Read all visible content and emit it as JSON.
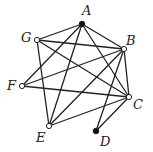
{
  "graph": {
    "nodes": [
      {
        "id": "A",
        "x": 82,
        "y": 24,
        "filled": true,
        "lx": 82,
        "ly": 15,
        "anchor": "start"
      },
      {
        "id": "G",
        "x": 37,
        "y": 40,
        "filled": false,
        "lx": 21,
        "ly": 42,
        "anchor": "start"
      },
      {
        "id": "B",
        "x": 124,
        "y": 49,
        "filled": false,
        "lx": 126,
        "ly": 45,
        "anchor": "start"
      },
      {
        "id": "F",
        "x": 22,
        "y": 86,
        "filled": false,
        "lx": 7,
        "ly": 90,
        "anchor": "start"
      },
      {
        "id": "C",
        "x": 129,
        "y": 97,
        "filled": false,
        "lx": 133,
        "ly": 109,
        "anchor": "start"
      },
      {
        "id": "E",
        "x": 49,
        "y": 126,
        "filled": false,
        "lx": 36,
        "ly": 142,
        "anchor": "start"
      },
      {
        "id": "D",
        "x": 96,
        "y": 131,
        "filled": true,
        "lx": 100,
        "ly": 146,
        "anchor": "start"
      }
    ],
    "edges": [
      [
        "A",
        "G"
      ],
      [
        "A",
        "B"
      ],
      [
        "A",
        "F"
      ],
      [
        "A",
        "E"
      ],
      [
        "A",
        "C"
      ],
      [
        "G",
        "B"
      ],
      [
        "G",
        "C"
      ],
      [
        "G",
        "E"
      ],
      [
        "B",
        "F"
      ],
      [
        "B",
        "E"
      ],
      [
        "B",
        "D"
      ],
      [
        "B",
        "C"
      ],
      [
        "F",
        "C"
      ],
      [
        "E",
        "C"
      ],
      [
        "C",
        "D"
      ]
    ],
    "colors": {
      "edge": "#222222",
      "node_stroke": "#222222",
      "filled": "#111111",
      "hollow": "#ffffff"
    }
  }
}
